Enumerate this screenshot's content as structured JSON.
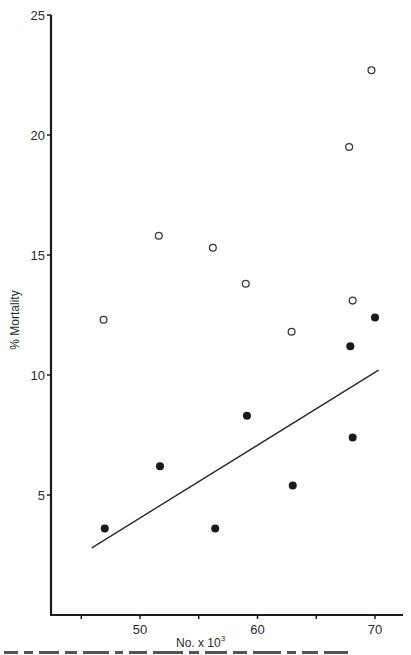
{
  "chart_data": {
    "type": "scatter",
    "title": "",
    "xlabel": "No. x 10",
    "xlabel_superscript": "3",
    "ylabel": "% Mortality",
    "xlim": [
      42.4,
      72.3
    ],
    "ylim": [
      0,
      25
    ],
    "x_ticks": [
      45,
      50,
      55,
      60,
      65,
      70
    ],
    "x_tick_labels": [
      "",
      "50",
      "",
      "60",
      "",
      "70"
    ],
    "y_ticks": [
      5,
      10,
      15,
      20,
      25
    ],
    "y_tick_labels": [
      "5",
      "10",
      "15",
      "20",
      "25"
    ],
    "grid": false,
    "legend": null,
    "series": [
      {
        "name": "open-circles",
        "marker": "open-circle",
        "x": [
          46.9,
          51.6,
          56.2,
          59.0,
          62.9,
          67.8,
          68.1,
          69.7
        ],
        "y": [
          12.3,
          15.8,
          15.3,
          13.8,
          11.8,
          19.5,
          13.1,
          22.7
        ]
      },
      {
        "name": "filled-circles",
        "marker": "filled-circle",
        "x": [
          47.0,
          51.7,
          56.4,
          59.1,
          63.0,
          67.9,
          68.1,
          70.0
        ],
        "y": [
          3.6,
          6.2,
          3.6,
          8.3,
          5.4,
          11.2,
          7.4,
          12.4
        ]
      }
    ],
    "regression_line": {
      "for_series": "filled-circles",
      "x": [
        45.9,
        70.3
      ],
      "y": [
        2.8,
        10.2
      ]
    }
  },
  "colors": {
    "ink": "#1a1a1a",
    "background": "#ffffff"
  }
}
